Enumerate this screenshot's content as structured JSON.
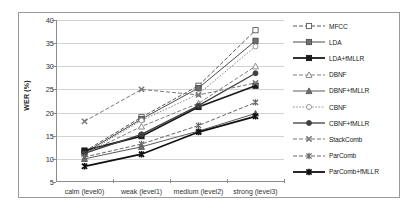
{
  "chart_data": {
    "type": "line",
    "title": "",
    "xlabel": "",
    "ylabel": "WER (%)",
    "categories": [
      "calm (level0)",
      "weak (level1)",
      "medium (level2)",
      "strong (level3)"
    ],
    "ylim": [
      5,
      40
    ],
    "yticks": [
      5,
      10,
      15,
      20,
      25,
      30,
      35,
      40
    ],
    "grid": true,
    "legend_position": "right",
    "series": [
      {
        "name": "MFCC",
        "values": [
          11.6,
          19.0,
          25.8,
          37.8
        ],
        "color": "#595959",
        "line": "dashed",
        "marker": "square-open",
        "width": 1.0
      },
      {
        "name": "LDA",
        "values": [
          11.3,
          18.6,
          25.3,
          35.5
        ],
        "color": "#4d4d4d",
        "line": "solid",
        "marker": "square-half",
        "width": 1.0
      },
      {
        "name": "LDA+fMLLR",
        "values": [
          11.8,
          14.9,
          21.2,
          25.8
        ],
        "color": "#1a1a1a",
        "line": "solid",
        "marker": "square-filled",
        "width": 1.8
      },
      {
        "name": "DBNF",
        "values": [
          11.0,
          17.0,
          22.0,
          30.0
        ],
        "color": "#7f7f7f",
        "line": "dashed",
        "marker": "triangle-open",
        "width": 1.0
      },
      {
        "name": "DBNF+fMLLR",
        "values": [
          10.0,
          12.6,
          16.0,
          19.8
        ],
        "color": "#5a5a5a",
        "line": "solid",
        "marker": "triangle-half",
        "width": 1.0
      },
      {
        "name": "CBNF",
        "values": [
          11.0,
          18.3,
          24.0,
          34.3
        ],
        "color": "#8c8c8c",
        "line": "dotted",
        "marker": "circle-open",
        "width": 1.0
      },
      {
        "name": "CBNF+fMLLR",
        "values": [
          11.2,
          15.3,
          21.5,
          28.5
        ],
        "color": "#404040",
        "line": "solid",
        "marker": "circle-filled",
        "width": 1.3
      },
      {
        "name": "StackComb",
        "values": [
          18.1,
          25.0,
          23.8,
          26.4
        ],
        "color": "#777777",
        "line": "dashed",
        "marker": "x-mark",
        "width": 1.0
      },
      {
        "name": "ParComb",
        "values": [
          10.4,
          13.2,
          17.2,
          22.2
        ],
        "color": "#666666",
        "line": "dashed",
        "marker": "asterisk",
        "width": 1.0
      },
      {
        "name": "ParComb+fMLLR",
        "values": [
          8.4,
          11.0,
          15.8,
          19.2
        ],
        "color": "#111111",
        "line": "solid",
        "marker": "asterisk-bold",
        "width": 1.8
      }
    ]
  }
}
